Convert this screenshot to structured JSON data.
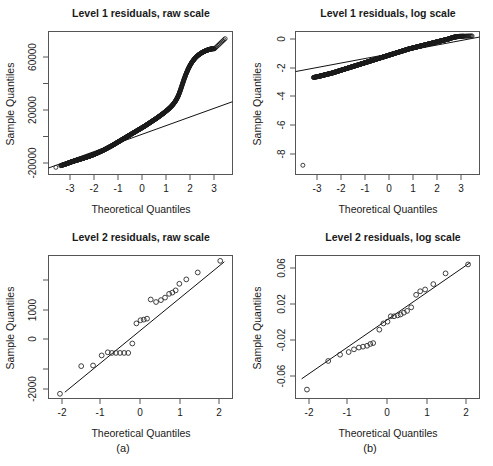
{
  "figure": {
    "subcaptions": [
      {
        "id": "a",
        "label": "(a)"
      },
      {
        "id": "b",
        "label": "(b)"
      }
    ],
    "axis_titles": {
      "x": "Theoretical Quantiles",
      "y": "Sample Quantiles"
    }
  },
  "chart_data": [
    {
      "panel": "top-left",
      "type": "scatter",
      "title": "Level 1 residuals, raw scale",
      "xlabel": "Theoretical Quantiles",
      "ylabel": "Sample Quantiles",
      "xlim": [
        -3.75,
        3.75
      ],
      "ylim": [
        -32000,
        78000
      ],
      "xticks": [
        -3,
        -2,
        -1,
        0,
        1,
        2,
        3
      ],
      "xticklabels": [
        "-3",
        "-2",
        "-1",
        "0",
        "1",
        "2",
        "3"
      ],
      "yticks": [
        -20000,
        0,
        20000,
        40000,
        60000
      ],
      "yticklabels": [
        "-20000",
        "",
        "20000",
        "",
        "60000"
      ],
      "grid": false,
      "legend": null,
      "reference_line": {
        "type": "qq-line",
        "x": [
          -3.75,
          3.75
        ],
        "y": [
          -27000,
          24000
        ]
      },
      "x": [
        -3.45,
        -3.25,
        -3.12,
        -3.02,
        -2.94,
        -2.86,
        -2.78,
        -2.7,
        -2.62,
        -2.54,
        -2.46,
        -2.38,
        -2.3,
        -2.22,
        -2.14,
        -2.06,
        -1.98,
        -1.9,
        -1.82,
        -1.74,
        -1.66,
        -1.58,
        -1.5,
        -1.42,
        -1.34,
        -1.26,
        -1.18,
        -1.1,
        -1.02,
        -0.94,
        -0.86,
        -0.78,
        -0.7,
        -0.62,
        -0.54,
        -0.46,
        -0.38,
        -0.3,
        -0.22,
        -0.14,
        -0.06,
        0.02,
        0.1,
        0.18,
        0.26,
        0.34,
        0.42,
        0.5,
        0.58,
        0.66,
        0.74,
        0.82,
        0.9,
        0.98,
        1.06,
        1.14,
        1.22,
        1.3,
        1.38,
        1.46,
        1.54,
        1.62,
        1.7,
        1.78,
        1.86,
        1.94,
        2.02,
        2.1,
        2.18,
        2.26,
        2.34,
        2.42,
        2.5,
        2.58,
        2.66,
        2.74,
        2.82,
        2.9,
        3.02,
        3.45
      ],
      "y": [
        -26500,
        -25200,
        -24400,
        -23800,
        -23200,
        -22600,
        -22100,
        -21600,
        -21100,
        -20700,
        -20200,
        -19800,
        -19300,
        -18800,
        -18300,
        -17800,
        -17200,
        -16600,
        -16000,
        -15300,
        -14600,
        -13900,
        -13200,
        -12400,
        -11600,
        -10800,
        -10000,
        -9100,
        -8200,
        -7300,
        -6400,
        -5500,
        -4600,
        -3700,
        -2800,
        -1900,
        -1000,
        -100,
        800,
        1700,
        2600,
        3500,
        4400,
        5300,
        6300,
        7300,
        8300,
        9300,
        10300,
        11300,
        12400,
        13500,
        14600,
        15800,
        17000,
        18300,
        19700,
        21300,
        23200,
        25500,
        28500,
        32500,
        37000,
        41500,
        45500,
        49000,
        52000,
        54500,
        56500,
        58200,
        59600,
        60700,
        61700,
        62500,
        63200,
        63800,
        64300,
        64600,
        64800,
        72500
      ],
      "point_marker": "open-circle"
    },
    {
      "panel": "top-right",
      "type": "scatter",
      "title": "Level 1 residuals, log scale",
      "xlabel": "Theoretical Quantiles",
      "ylabel": "Sample Quantiles",
      "xlim": [
        -3.75,
        3.75
      ],
      "ylim": [
        -9.8,
        1.8
      ],
      "xticks": [
        -3,
        -2,
        -1,
        0,
        1,
        2,
        3
      ],
      "xticklabels": [
        "-3",
        "-2",
        "-1",
        "0",
        "1",
        "2",
        "3"
      ],
      "yticks": [
        -8,
        -6,
        -4,
        -2,
        0
      ],
      "yticklabels": [
        "-8",
        "-6",
        "-4",
        "-2",
        "0"
      ],
      "grid": false,
      "legend": null,
      "reference_line": {
        "type": "qq-line",
        "x": [
          -3.75,
          3.75
        ],
        "y": [
          -1.45,
          1.35
        ]
      },
      "x": [
        -3.45,
        -3.02,
        -2.9,
        -2.8,
        -2.72,
        -2.64,
        -2.56,
        -2.48,
        -2.4,
        -2.32,
        -2.24,
        -2.16,
        -2.08,
        -2.0,
        -1.92,
        -1.84,
        -1.76,
        -1.68,
        -1.6,
        -1.52,
        -1.44,
        -1.36,
        -1.28,
        -1.2,
        -1.12,
        -1.04,
        -0.96,
        -0.88,
        -0.8,
        -0.72,
        -0.64,
        -0.56,
        -0.48,
        -0.4,
        -0.32,
        -0.24,
        -0.16,
        -0.08,
        0.0,
        0.08,
        0.16,
        0.24,
        0.32,
        0.4,
        0.48,
        0.56,
        0.64,
        0.72,
        0.8,
        0.88,
        0.96,
        1.04,
        1.12,
        1.2,
        1.28,
        1.36,
        1.44,
        1.52,
        1.6,
        1.68,
        1.76,
        1.84,
        1.92,
        2.0,
        2.08,
        2.16,
        2.24,
        2.32,
        2.4,
        2.48,
        2.56,
        2.64,
        2.72,
        2.8,
        2.88,
        2.96,
        3.1,
        3.45
      ],
      "y": [
        -9.05,
        -1.93,
        -1.88,
        -1.84,
        -1.8,
        -1.76,
        -1.72,
        -1.68,
        -1.64,
        -1.6,
        -1.56,
        -1.51,
        -1.46,
        -1.41,
        -1.36,
        -1.31,
        -1.26,
        -1.21,
        -1.16,
        -1.11,
        -1.06,
        -1.01,
        -0.96,
        -0.91,
        -0.86,
        -0.81,
        -0.76,
        -0.71,
        -0.66,
        -0.61,
        -0.56,
        -0.51,
        -0.46,
        -0.41,
        -0.36,
        -0.31,
        -0.26,
        -0.21,
        -0.16,
        -0.11,
        -0.06,
        -0.01,
        0.04,
        0.09,
        0.14,
        0.19,
        0.24,
        0.29,
        0.34,
        0.39,
        0.43,
        0.47,
        0.51,
        0.55,
        0.59,
        0.63,
        0.67,
        0.71,
        0.75,
        0.79,
        0.83,
        0.87,
        0.91,
        0.95,
        0.99,
        1.03,
        1.07,
        1.11,
        1.15,
        1.19,
        1.24,
        1.3,
        1.34,
        1.37,
        1.39,
        1.41,
        1.42,
        1.44
      ],
      "point_marker": "open-circle",
      "annotations": [
        {
          "text": "outlier",
          "x": -3.45,
          "y": -9.05
        }
      ]
    },
    {
      "panel": "bottom-left",
      "type": "scatter",
      "title": "Level 2 residuals, raw scale",
      "xlabel": "Theoretical Quantiles",
      "ylabel": "Sample Quantiles",
      "xlim": [
        -2.25,
        2.25
      ],
      "ylim": [
        -2450,
        2100
      ],
      "xticks": [
        -2,
        -1,
        0,
        1,
        2
      ],
      "xticklabels": [
        "-2",
        "-1",
        "0",
        "1",
        "2"
      ],
      "yticks": [
        -2000,
        -1000,
        0,
        1000,
        2000
      ],
      "yticklabels": [
        "-2000",
        "",
        "0",
        "1000",
        ""
      ],
      "grid": false,
      "legend": null,
      "reference_line": {
        "type": "qq-line",
        "x": [
          -1.85,
          2.05
        ],
        "y": [
          -2250,
          1900
        ]
      },
      "x": [
        -1.97,
        -1.45,
        -1.16,
        -0.95,
        -0.8,
        -0.7,
        -0.6,
        -0.5,
        -0.4,
        -0.3,
        -0.2,
        -0.1,
        0.0,
        0.08,
        0.16,
        0.25,
        0.38,
        0.5,
        0.6,
        0.7,
        0.78,
        0.86,
        0.95,
        1.12,
        1.4,
        1.95
      ],
      "y": [
        -2300,
        -1420,
        -1400,
        -1080,
        -980,
        -1000,
        -1000,
        -1000,
        -1000,
        -1000,
        -700,
        -60,
        40,
        60,
        90,
        700,
        620,
        680,
        760,
        880,
        920,
        990,
        1200,
        1340,
        1560,
        1930
      ],
      "point_marker": "open-circle"
    },
    {
      "panel": "bottom-right",
      "type": "scatter",
      "title": "Level 2 residuals, log scale",
      "xlabel": "Theoretical Quantiles",
      "ylabel": "Sample Quantiles",
      "xlim": [
        -2.25,
        2.25
      ],
      "ylim": [
        -0.092,
        0.068
      ],
      "xticks": [
        -2,
        -1,
        0,
        1,
        2
      ],
      "xticklabels": [
        "-2",
        "-1",
        "0",
        "1",
        "2"
      ],
      "yticks": [
        -0.06,
        -0.02,
        0.02,
        0.06
      ],
      "yticklabels": [
        "-0.06",
        "-0.02",
        "0.02",
        "0.06"
      ],
      "grid": false,
      "legend": null,
      "reference_line": {
        "type": "qq-line",
        "x": [
          -2.1,
          2.02
        ],
        "y": [
          -0.07,
          0.06
        ]
      },
      "x": [
        -1.97,
        -1.45,
        -1.16,
        -0.95,
        -0.82,
        -0.7,
        -0.6,
        -0.5,
        -0.42,
        -0.35,
        -0.2,
        -0.1,
        0.0,
        0.08,
        0.16,
        0.25,
        0.32,
        0.4,
        0.48,
        0.58,
        0.7,
        0.8,
        0.92,
        1.12,
        1.42,
        1.97
      ],
      "y": [
        -0.082,
        -0.05,
        -0.043,
        -0.04,
        -0.037,
        -0.035,
        -0.034,
        -0.033,
        -0.031,
        -0.03,
        -0.015,
        -0.008,
        -0.006,
        0.0,
        0.0,
        0.001,
        0.002,
        0.004,
        0.006,
        0.01,
        0.024,
        0.028,
        0.03,
        0.036,
        0.048,
        0.058
      ],
      "point_marker": "open-circle"
    }
  ]
}
